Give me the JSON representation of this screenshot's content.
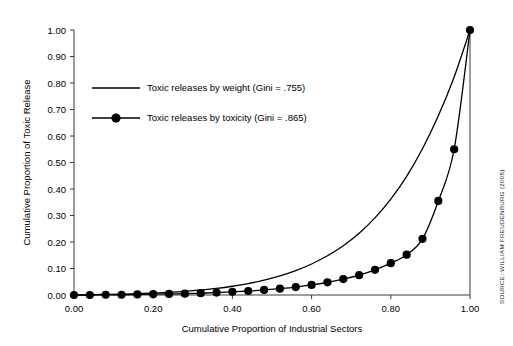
{
  "source_note": "SOURCE: WILLIAM FREUDENBURG (2005)",
  "chart_data": {
    "type": "line",
    "title": "",
    "xlabel": "Cumulative Proportion of Industrial Sectors",
    "ylabel": "Cumulative Proportion of Toxic Release",
    "xlim": [
      0.0,
      1.0
    ],
    "ylim": [
      0.0,
      1.0
    ],
    "grid": false,
    "legend_position": "upper-left-inside",
    "xticks": [
      0.0,
      0.2,
      0.4,
      0.6,
      0.8,
      1.0
    ],
    "xticklabels": [
      "0.00",
      "0.20",
      "0.40",
      "0.60",
      "0.80",
      "1.00"
    ],
    "yticks": [
      0.0,
      0.1,
      0.2,
      0.3,
      0.4,
      0.5,
      0.6,
      0.7,
      0.8,
      0.9,
      1.0
    ],
    "yticklabels": [
      "0.00",
      "0.10",
      "0.20",
      "0.30",
      "0.40",
      "0.50",
      "0.60",
      "0.70",
      "0.80",
      "0.90",
      "1.00"
    ],
    "series": [
      {
        "name": "Toxic releases by weight (Gini = .755)",
        "gini": ".755",
        "marker": "none",
        "color": "#000000",
        "x": [
          0.0,
          0.04,
          0.08,
          0.12,
          0.16,
          0.2,
          0.24,
          0.28,
          0.32,
          0.36,
          0.4,
          0.44,
          0.48,
          0.52,
          0.56,
          0.6,
          0.64,
          0.68,
          0.72,
          0.76,
          0.8,
          0.84,
          0.88,
          0.92,
          0.96,
          1.0
        ],
        "y": [
          0.0,
          0.001,
          0.002,
          0.003,
          0.005,
          0.007,
          0.01,
          0.014,
          0.019,
          0.025,
          0.033,
          0.043,
          0.056,
          0.072,
          0.092,
          0.117,
          0.148,
          0.186,
          0.233,
          0.291,
          0.362,
          0.448,
          0.552,
          0.676,
          0.823,
          1.0
        ]
      },
      {
        "name": "Toxic releases by toxicity (Gini = .865)",
        "gini": ".865",
        "marker": "circle",
        "color": "#000000",
        "x": [
          0.0,
          0.04,
          0.08,
          0.12,
          0.16,
          0.2,
          0.24,
          0.28,
          0.32,
          0.36,
          0.4,
          0.44,
          0.48,
          0.52,
          0.56,
          0.6,
          0.64,
          0.68,
          0.72,
          0.76,
          0.8,
          0.84,
          0.88,
          0.92,
          0.96,
          1.0
        ],
        "y": [
          0.0,
          0.0,
          0.001,
          0.001,
          0.002,
          0.003,
          0.004,
          0.005,
          0.007,
          0.009,
          0.012,
          0.015,
          0.019,
          0.024,
          0.03,
          0.038,
          0.048,
          0.06,
          0.075,
          0.095,
          0.12,
          0.152,
          0.212,
          0.355,
          0.55,
          1.0
        ]
      }
    ]
  }
}
